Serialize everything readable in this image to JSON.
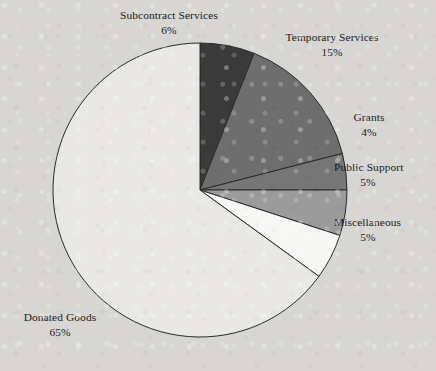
{
  "chart_data": {
    "type": "pie",
    "title": "",
    "subtitle": "",
    "xlabel": "",
    "ylabel": "",
    "grid": false,
    "legend_position": "none",
    "label_format": "name above percent",
    "start_angle_deg": 0,
    "direction": "clockwise",
    "background_color": "#d7d6d3",
    "outline_color": "#2b2b2b",
    "categories": [
      "Subcontract Services",
      "Temporary Services",
      "Grants",
      "Public Support",
      "Miscellaneous",
      "Donated Goods"
    ],
    "values": [
      6,
      15,
      4,
      5,
      5,
      65
    ],
    "value_labels": [
      "6%",
      "15%",
      "4%",
      "5%",
      "5%",
      "65%"
    ],
    "colors": [
      "#3a3a3a",
      "#6e6e6e",
      "#767676",
      "#9b9b9b",
      "#f7f7f5",
      "#e9e8e5"
    ],
    "slices": [
      {
        "name": "Subcontract Services",
        "value": 6,
        "value_label": "6%",
        "color": "#3a3a3a",
        "start_deg": 0,
        "end_deg": 21.6
      },
      {
        "name": "Temporary Services",
        "value": 15,
        "value_label": "15%",
        "color": "#6e6e6e",
        "start_deg": 21.6,
        "end_deg": 75.6
      },
      {
        "name": "Grants",
        "value": 4,
        "value_label": "4%",
        "color": "#767676",
        "start_deg": 75.6,
        "end_deg": 90.0
      },
      {
        "name": "Public Support",
        "value": 5,
        "value_label": "5%",
        "color": "#9b9b9b",
        "start_deg": 90.0,
        "end_deg": 108.0
      },
      {
        "name": "Miscellaneous",
        "value": 5,
        "value_label": "5%",
        "color": "#f7f7f5",
        "start_deg": 108.0,
        "end_deg": 126.0
      },
      {
        "name": "Donated Goods",
        "value": 65,
        "value_label": "65%",
        "color": "#e9e8e5",
        "start_deg": 126.0,
        "end_deg": 360.0
      }
    ],
    "geometry": {
      "center_x": 200,
      "center_y": 190,
      "radius": 147
    }
  }
}
